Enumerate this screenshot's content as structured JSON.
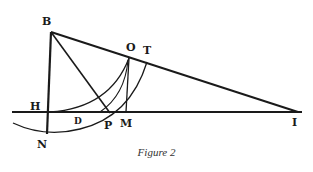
{
  "figure": {
    "caption": "Figure 2",
    "labels": {
      "B": "B",
      "O": "O",
      "T": "T",
      "H": "H",
      "D": "D",
      "P": "P",
      "M": "M",
      "N": "N",
      "I": "I"
    },
    "colors": {
      "ink": "#1a1a1a",
      "background": "#ffffff",
      "caption": "#333333"
    }
  }
}
